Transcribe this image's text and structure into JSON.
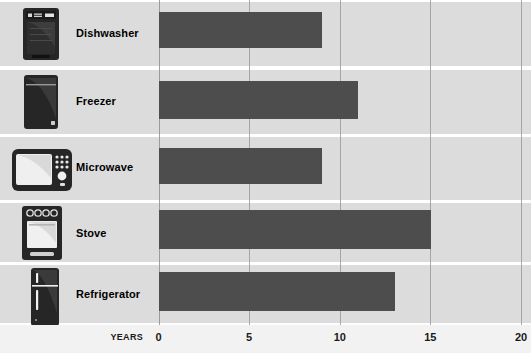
{
  "chart_data": {
    "type": "bar",
    "orientation": "horizontal",
    "title": "",
    "xlabel": "YEARS",
    "ylabel": "",
    "xlim": [
      0,
      20
    ],
    "xticks": [
      "0",
      "5",
      "10",
      "15",
      "20"
    ],
    "xtick_values": [
      0,
      5,
      10,
      15,
      20
    ],
    "grid": true,
    "legend": "none",
    "categories": [
      "Dishwasher",
      "Freezer",
      "Microwave",
      "Stove",
      "Refrigerator"
    ],
    "values": [
      9,
      11,
      9,
      15,
      13
    ],
    "bars": [
      {
        "label": "Dishwasher",
        "value": 9,
        "icon": "dishwasher-icon"
      },
      {
        "label": "Freezer",
        "value": 11,
        "icon": "freezer-icon"
      },
      {
        "label": "Microwave",
        "value": 9,
        "icon": "microwave-icon"
      },
      {
        "label": "Stove",
        "value": 15,
        "icon": "stove-icon"
      },
      {
        "label": "Refrigerator",
        "value": 13,
        "icon": "refrigerator-icon"
      }
    ],
    "colors": {
      "bar": "#4d4d4d",
      "band": "#dcdcdc",
      "gridline": "#9b9b9b",
      "axis_background": "#f2f2f2",
      "icon": "#262626",
      "text": "#000000"
    }
  },
  "axis": {
    "unit_label": "YEARS",
    "ticks": [
      {
        "text": "0",
        "value": 0
      },
      {
        "text": "5",
        "value": 5
      },
      {
        "text": "10",
        "value": 10
      },
      {
        "text": "15",
        "value": 15
      },
      {
        "text": "20",
        "value": 20
      }
    ]
  }
}
